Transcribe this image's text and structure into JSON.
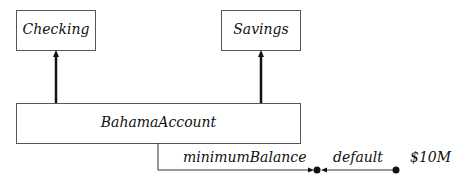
{
  "diagram": {
    "type": "uml-class-inheritance",
    "classes": [
      {
        "id": "checking",
        "label": "Checking"
      },
      {
        "id": "savings",
        "label": "Savings"
      },
      {
        "id": "bahama",
        "label": "BahamaAccount"
      }
    ],
    "edges": [
      {
        "from": "bahama",
        "to": "checking",
        "kind": "inheritance"
      },
      {
        "from": "bahama",
        "to": "savings",
        "kind": "inheritance"
      }
    ],
    "attribute": {
      "name": "minimumBalance",
      "default_label": "default",
      "default_value": "$10M"
    },
    "colors": {
      "line": "#111111",
      "box_border": "#555555",
      "background": "#ffffff"
    }
  }
}
